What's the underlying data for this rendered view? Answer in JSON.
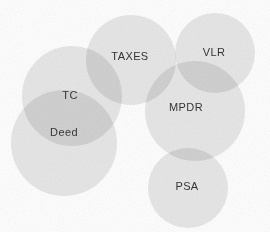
{
  "diagram": {
    "type": "euler-venn",
    "width": 270,
    "height": 232,
    "background_color": "#fefefe",
    "fill_color": "#dcdcdc",
    "fill_opacity": 0.72,
    "overlap_color": "#c4c4c4",
    "label_color": "#2b2b2b",
    "label_font_size": 11,
    "sets": [
      {
        "id": "tc",
        "label": "TC",
        "cx": 72,
        "cy": 96,
        "r": 50,
        "label_x": 70,
        "label_y": 96
      },
      {
        "id": "deed",
        "label": "Deed",
        "cx": 64,
        "cy": 143,
        "r": 53,
        "label_x": 64,
        "label_y": 133
      },
      {
        "id": "taxes",
        "label": "TAXES",
        "cx": 131,
        "cy": 60,
        "r": 45,
        "label_x": 130,
        "label_y": 57
      },
      {
        "id": "vlr",
        "label": "VLR",
        "cx": 215,
        "cy": 53,
        "r": 40,
        "label_x": 214,
        "label_y": 53
      },
      {
        "id": "mpdr",
        "label": "MPDR",
        "cx": 195,
        "cy": 111,
        "r": 50,
        "label_x": 186,
        "label_y": 108
      },
      {
        "id": "psa",
        "label": "PSA",
        "cx": 188,
        "cy": 188,
        "r": 40,
        "label_x": 187,
        "label_y": 187
      }
    ],
    "overlaps": [
      {
        "between": [
          "tc",
          "deed"
        ],
        "shade": "dark"
      },
      {
        "between": [
          "tc",
          "taxes"
        ],
        "shade": "dark"
      },
      {
        "between": [
          "deed",
          "taxes"
        ],
        "shade": "dark"
      },
      {
        "between": [
          "taxes",
          "mpdr"
        ],
        "shade": "dark"
      },
      {
        "between": [
          "vlr",
          "mpdr"
        ],
        "shade": "dark"
      },
      {
        "between": [
          "mpdr",
          "psa"
        ],
        "shade": "dark"
      }
    ]
  }
}
